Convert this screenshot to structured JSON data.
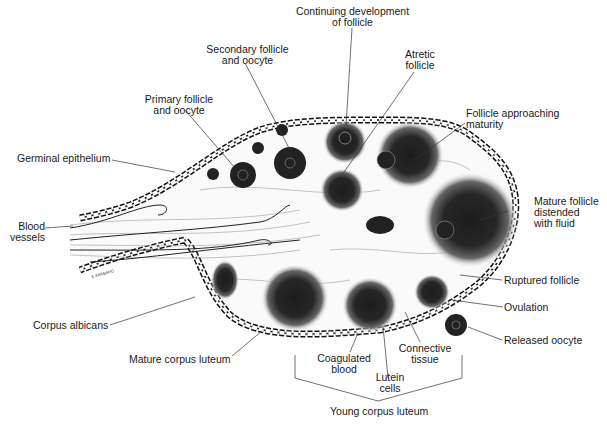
{
  "diagram": {
    "labels": {
      "continuing_development": {
        "line1": "Continuing development",
        "line2": "of follicle"
      },
      "secondary_follicle": {
        "line1": "Secondary follicle",
        "line2": "and oocyte"
      },
      "atretic_follicle": {
        "line1": "Atretic",
        "line2": "follicle"
      },
      "primary_follicle": {
        "line1": "Primary follicle",
        "line2": "and oocyte"
      },
      "follicle_approaching": {
        "line1": "Follicle approaching",
        "line2": "maturity"
      },
      "germinal_epithelium": {
        "line1": "Germinal epithelium"
      },
      "mature_follicle": {
        "line1": "Mature follicle",
        "line2": "distended",
        "line3": "with fluid"
      },
      "blood_vessels": {
        "line1": "Blood",
        "line2": "vessels"
      },
      "ruptured_follicle": {
        "line1": "Ruptured follicle"
      },
      "ovulation": {
        "line1": "Ovulation"
      },
      "corpus_albicans": {
        "line1": "Corpus albicans"
      },
      "released_oocyte": {
        "line1": "Released oocyte"
      },
      "mature_corpus_luteum": {
        "line1": "Mature corpus luteum"
      },
      "coagulated_blood": {
        "line1": "Coagulated",
        "line2": "blood"
      },
      "connective_tissue": {
        "line1": "Connective",
        "line2": "tissue"
      },
      "lutein_cells": {
        "line1": "Lutein",
        "line2": "cells"
      },
      "young_corpus_luteum": {
        "line1": "Young corpus luteum"
      }
    },
    "signature": "E.KASBAHO",
    "colors": {
      "ink": "#1a1a1a",
      "fill_dark": "#222222",
      "stroma": "#9a9a9a",
      "background": "#ffffff"
    }
  }
}
